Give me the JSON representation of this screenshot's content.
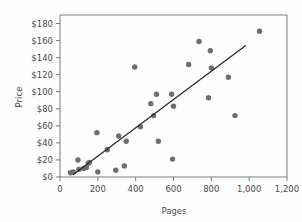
{
  "chart_data": {
    "type": "scatter",
    "title": "",
    "xlabel": "Pages",
    "ylabel": "Price",
    "xlim": [
      0,
      1200
    ],
    "ylim": [
      0,
      190
    ],
    "grid": false,
    "legend": null,
    "xticks": [
      0,
      200,
      400,
      600,
      800,
      1000,
      1200
    ],
    "xticklabels": [
      "0",
      "200",
      "400",
      "600",
      "800",
      "1,000",
      "1,200"
    ],
    "yticks": [
      0,
      20,
      40,
      60,
      80,
      100,
      120,
      140,
      160,
      180
    ],
    "yticklabels": [
      "$0",
      "$20",
      "$40",
      "$60",
      "$80",
      "$100",
      "$120",
      "$140",
      "$160",
      "$180"
    ],
    "point_color": "#6e6e72",
    "line_color": "#2a2a2a",
    "frame_color": "#7a7a7a",
    "series": [
      {
        "name": "Books",
        "points": [
          [
            55,
            5
          ],
          [
            70,
            6
          ],
          [
            95,
            20
          ],
          [
            100,
            9
          ],
          [
            125,
            10
          ],
          [
            140,
            11
          ],
          [
            150,
            16
          ],
          [
            155,
            17
          ],
          [
            195,
            52
          ],
          [
            200,
            6
          ],
          [
            250,
            32
          ],
          [
            295,
            8
          ],
          [
            310,
            48
          ],
          [
            340,
            13
          ],
          [
            350,
            42
          ],
          [
            395,
            129
          ],
          [
            425,
            59
          ],
          [
            480,
            86
          ],
          [
            495,
            72
          ],
          [
            510,
            97
          ],
          [
            520,
            42
          ],
          [
            590,
            97
          ],
          [
            595,
            21
          ],
          [
            600,
            83
          ],
          [
            680,
            132
          ],
          [
            735,
            159
          ],
          [
            785,
            93
          ],
          [
            795,
            148
          ],
          [
            800,
            128
          ],
          [
            890,
            117
          ],
          [
            925,
            72
          ],
          [
            1055,
            171
          ]
        ]
      }
    ],
    "trend_line": {
      "name": "fit-line",
      "x0": 70,
      "y0": 3,
      "x1": 980,
      "y1": 154
    }
  },
  "axes": {
    "x_axis_name": "Pages",
    "y_axis_name": "Price"
  }
}
